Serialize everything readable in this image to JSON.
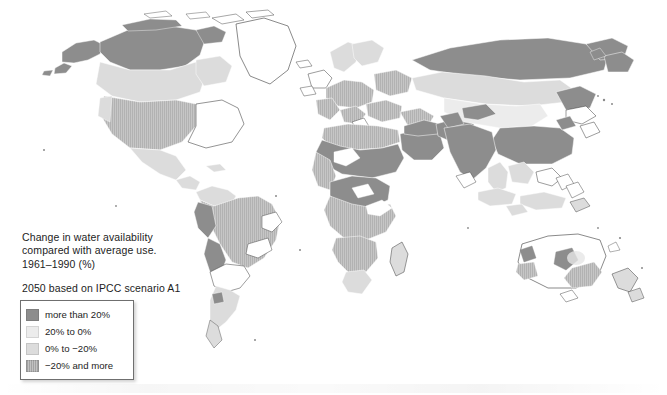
{
  "figure": {
    "title_icon": "world-map-icon",
    "caption_lines": [
      "Change in water availability",
      "compared with average use.",
      "1961–1990 (%)"
    ],
    "scenario_note": "2050 based on IPCC scenario A1"
  },
  "legend": {
    "items": [
      {
        "label": "more than 20%",
        "swatch": "dark",
        "color": "#8d8d8d"
      },
      {
        "label": "20% to 0%",
        "swatch": "vlight",
        "color": "#ececec"
      },
      {
        "label": "0% to −20%",
        "swatch": "light",
        "color": "#dcdcdc"
      },
      {
        "label": "−20% and more",
        "swatch": "mid",
        "color": "#c2c2c2"
      }
    ]
  },
  "map": {
    "projection": "world-equirectangular",
    "background_color": "#ffffff",
    "coastline_color": "#3a3a3a",
    "border_color": "#ffffff",
    "classes": {
      "dark": "#8d8d8d",
      "mid": "#c2c2c2",
      "light": "#dcdcdc",
      "vlight": "#ececec",
      "none": "#ffffff"
    },
    "regions_summary": [
      {
        "name": "Alaska and northern Canada",
        "class": "dark"
      },
      {
        "name": "Central and western United States",
        "class": "mid"
      },
      {
        "name": "Eastern United States",
        "class": "none"
      },
      {
        "name": "Greenland",
        "class": "none"
      },
      {
        "name": "Mexico and Central America",
        "class": "light"
      },
      {
        "name": "Amazon basin and Brazil",
        "class": "mid"
      },
      {
        "name": "Andes – Peru and Bolivia",
        "class": "dark"
      },
      {
        "name": "Argentina and southern cone",
        "class": "light"
      },
      {
        "name": "Northern Europe and Scandinavia",
        "class": "light"
      },
      {
        "name": "Western and central Europe",
        "class": "mid"
      },
      {
        "name": "Mediterranean and North Africa",
        "class": "mid"
      },
      {
        "name": "Sahel and West Africa",
        "class": "dark"
      },
      {
        "name": "Central and southern Africa",
        "class": "mid"
      },
      {
        "name": "Arabian peninsula and Middle East",
        "class": "dark"
      },
      {
        "name": "Siberia and northern Russia",
        "class": "dark"
      },
      {
        "name": "Central Asia",
        "class": "light"
      },
      {
        "name": "India and South Asia",
        "class": "dark"
      },
      {
        "name": "Eastern China and Southeast Asia",
        "class": "dark"
      },
      {
        "name": "Indonesia and maritime Asia",
        "class": "light"
      },
      {
        "name": "Australia interior",
        "class": "none"
      },
      {
        "name": "Southeastern Australia",
        "class": "mid"
      },
      {
        "name": "Central Australia patch",
        "class": "dark"
      },
      {
        "name": "New Zealand",
        "class": "light"
      }
    ]
  }
}
